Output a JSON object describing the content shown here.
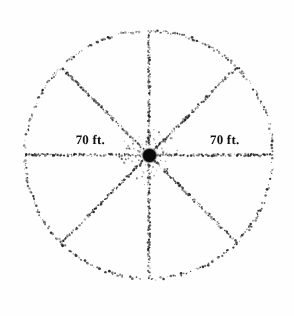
{
  "figure": {
    "kind": "stippled-wheel-diagram",
    "width": 294,
    "height": 316,
    "background_color": "#fefefe",
    "ink_color": "#1a1a1a"
  },
  "wheel": {
    "center_x": 149,
    "center_y": 155,
    "radius": 124,
    "rim_style": "stippled-dotted",
    "spoke_count": 8,
    "spoke_angles_deg": [
      0,
      45,
      90,
      135,
      180,
      225,
      270,
      315
    ],
    "spoke_style": "stippled-dotted"
  },
  "hub": {
    "label": "hub",
    "diameter": 13,
    "color": "#0b0b0b"
  },
  "labels": {
    "left": {
      "text": "70 ft.",
      "x": 105,
      "y": 133
    },
    "right": {
      "text": "70 ft.",
      "x": 210,
      "y": 133
    }
  },
  "chart_data": {
    "type": "scatter",
    "title": "",
    "xlabel": "",
    "ylabel": "",
    "annotations": [
      "70 ft.",
      "70 ft."
    ],
    "series": [
      {
        "name": "rim",
        "shape": "circle",
        "center": [
          149,
          155
        ],
        "radius": 124
      },
      {
        "name": "spokes",
        "shape": "radial-lines",
        "center": [
          149,
          155
        ],
        "length": 124,
        "angles_deg": [
          0,
          45,
          90,
          135,
          180,
          225,
          270,
          315
        ]
      },
      {
        "name": "hub",
        "shape": "filled-circle",
        "center": [
          149,
          155
        ],
        "radius": 6.5
      }
    ],
    "measurements": [
      {
        "label": "70 ft.",
        "value": 70,
        "unit": "ft",
        "quantity": "radius",
        "side": "left"
      },
      {
        "label": "70 ft.",
        "value": 70,
        "unit": "ft",
        "quantity": "radius",
        "side": "right"
      }
    ],
    "grid": false,
    "legend": "none"
  }
}
